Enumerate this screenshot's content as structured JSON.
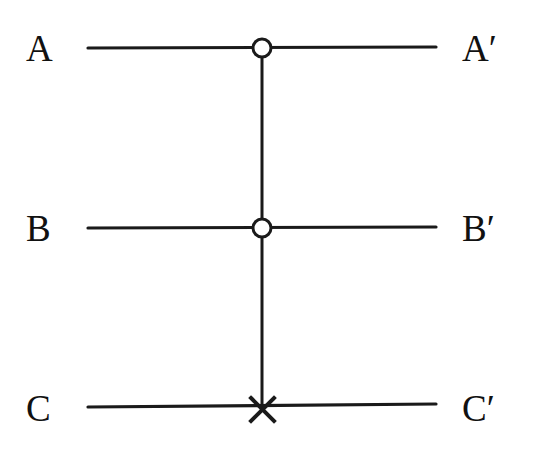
{
  "diagram": {
    "type": "quantum-circuit",
    "gate": "controlled-controlled-NOT",
    "colors": {
      "line": "#1a1a1a",
      "background": "#ffffff",
      "control_fill": "#ffffff"
    },
    "wires": [
      {
        "id": "A",
        "input_label": "A",
        "output_label": "A′",
        "y": 48,
        "element": "control"
      },
      {
        "id": "B",
        "input_label": "B",
        "output_label": "B′",
        "y": 228,
        "element": "control"
      },
      {
        "id": "C",
        "input_label": "C",
        "output_label": "C′",
        "y": 406,
        "element": "target-x"
      }
    ],
    "wire_x_start": 88,
    "wire_x_end": 436,
    "gate_x": 262
  }
}
